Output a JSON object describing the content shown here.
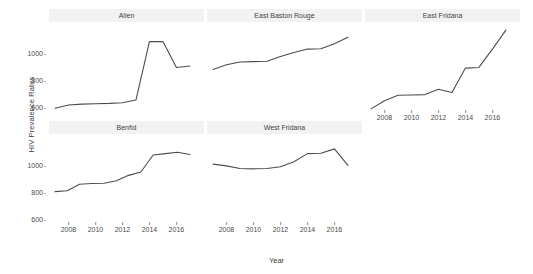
{
  "chart_data": {
    "type": "line",
    "title": "",
    "xlabel": "Year",
    "ylabel": "HIV Prevalence Rates",
    "facet_layout": "3 columns x 2 rows (faceted small multiples)",
    "grid": false,
    "legend": "none",
    "line_color": "#4d4d4d",
    "strip_background": "#f2f2f2",
    "xlim": [
      2007,
      2017.6
    ],
    "ylim": [
      460,
      1130
    ],
    "x_ticks": [
      2008,
      2010,
      2012,
      2014,
      2016
    ],
    "x_tick_labels": [
      "2008",
      "2010",
      "2012",
      "2014",
      "2016"
    ],
    "y_ticks": [
      600,
      800,
      1000
    ],
    "y_tick_labels": [
      "600",
      "800",
      "1000"
    ],
    "x": [
      2007,
      2008,
      2009,
      2010,
      2011,
      2012,
      2013,
      2014,
      2015,
      2016,
      2017
    ],
    "panels": [
      {
        "name": "Allen",
        "row": 0,
        "col": 0,
        "series": [
          {
            "name": "Allen",
            "values": [
              525,
              548,
              555,
              558,
              560,
              565,
              585,
              1015,
              1015,
              825,
              835
            ]
          }
        ]
      },
      {
        "name": "East Baston Rouge",
        "row": 0,
        "col": 1,
        "series": [
          {
            "name": "East Baston Rouge",
            "values": [
              810,
              845,
              865,
              868,
              870,
              905,
              935,
              960,
              962,
              1000,
              1048
            ]
          }
        ]
      },
      {
        "name": "East Fridana",
        "row": 0,
        "col": 2,
        "series": [
          {
            "name": "East Fridana",
            "values": [
              520,
              580,
              620,
              622,
              625,
              665,
              640,
              820,
              825,
              960,
              1100
            ]
          }
        ]
      },
      {
        "name": "Benfid",
        "row": 1,
        "col": 0,
        "series": [
          {
            "name": "Benfid",
            "values": [
              735,
              742,
              790,
              795,
              797,
              815,
              855,
              880,
              1005,
              1015,
              1025,
              1008
            ]
          }
        ]
      },
      {
        "name": "West Fridana",
        "row": 1,
        "col": 1,
        "series": [
          {
            "name": "West Fridana",
            "values": [
              938,
              925,
              905,
              903,
              905,
              918,
              955,
              1015,
              1018,
              1050,
              928
            ]
          }
        ]
      }
    ]
  },
  "axes": {
    "y_title": "HIV Prevalence Rates",
    "x_title": "Year",
    "y_tick_1000": "1000",
    "y_tick_800": "800",
    "y_tick_600": "600",
    "x_tick_2008": "2008",
    "x_tick_2010": "2010",
    "x_tick_2012": "2012",
    "x_tick_2014": "2014",
    "x_tick_2016": "2016"
  },
  "panel_titles": {
    "allen": "Allen",
    "east_baston_rouge": "East Baston Rouge",
    "east_fridana": "East Fridana",
    "benfid": "Benfid",
    "west_fridana": "West Fridana"
  }
}
